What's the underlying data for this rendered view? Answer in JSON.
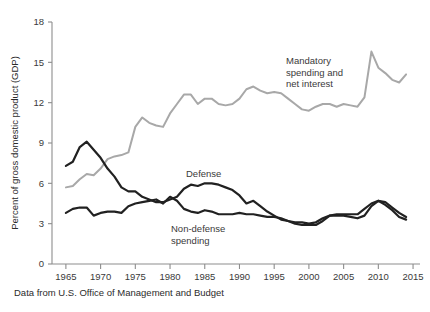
{
  "chart_data": {
    "type": "line",
    "title": "",
    "xlabel": "",
    "ylabel": "Percent of gross domestic product (GDP)",
    "caption": "Data from U.S. Office of Management and Budget",
    "xlim": [
      1963,
      2016
    ],
    "ylim": [
      0,
      18
    ],
    "x_ticks": [
      1965,
      1970,
      1975,
      1980,
      1985,
      1990,
      1995,
      2000,
      2005,
      2010,
      2015
    ],
    "y_ticks": [
      0,
      3,
      6,
      9,
      12,
      15,
      18
    ],
    "grid": false,
    "legend_position": "inline-annotations",
    "colors": {
      "mandatory": "#a8a8a8",
      "defense": "#212121",
      "nondefense": "#212121",
      "axis": "#8d8d8d",
      "text": "#2b2b2b",
      "background": "#ffffff"
    },
    "series": [
      {
        "name": "Mandatory spending and net interest",
        "color": "#a8a8a8",
        "label_lines": [
          "Mandatory",
          "spending and",
          "net interest"
        ],
        "x": [
          1965,
          1966,
          1967,
          1968,
          1969,
          1970,
          1971,
          1972,
          1973,
          1974,
          1975,
          1976,
          1977,
          1978,
          1979,
          1980,
          1981,
          1982,
          1983,
          1984,
          1985,
          1986,
          1987,
          1988,
          1989,
          1990,
          1991,
          1992,
          1993,
          1994,
          1995,
          1996,
          1997,
          1998,
          1999,
          2000,
          2001,
          2002,
          2003,
          2004,
          2005,
          2006,
          2007,
          2008,
          2009,
          2010,
          2011,
          2012,
          2013,
          2014
        ],
        "values": [
          5.7,
          5.8,
          6.3,
          6.7,
          6.6,
          7.1,
          7.8,
          8.0,
          8.1,
          8.3,
          10.2,
          10.9,
          10.5,
          10.3,
          10.2,
          11.2,
          11.9,
          12.6,
          12.6,
          11.9,
          12.3,
          12.3,
          11.9,
          11.8,
          11.9,
          12.3,
          13.0,
          13.2,
          12.9,
          12.7,
          12.8,
          12.7,
          12.3,
          11.9,
          11.5,
          11.4,
          11.7,
          11.9,
          11.9,
          11.7,
          11.9,
          11.8,
          11.7,
          12.4,
          15.8,
          14.6,
          14.2,
          13.7,
          13.5,
          14.1
        ]
      },
      {
        "name": "Defense",
        "color": "#212121",
        "label": "Defense",
        "x": [
          1965,
          1966,
          1967,
          1968,
          1969,
          1970,
          1971,
          1972,
          1973,
          1974,
          1975,
          1976,
          1977,
          1978,
          1979,
          1980,
          1981,
          1982,
          1983,
          1984,
          1985,
          1986,
          1987,
          1988,
          1989,
          1990,
          1991,
          1992,
          1993,
          1994,
          1995,
          1996,
          1997,
          1998,
          1999,
          2000,
          2001,
          2002,
          2003,
          2004,
          2005,
          2006,
          2007,
          2008,
          2009,
          2010,
          2011,
          2012,
          2013,
          2014
        ],
        "values": [
          7.3,
          7.6,
          8.7,
          9.1,
          8.5,
          7.9,
          7.1,
          6.5,
          5.7,
          5.4,
          5.4,
          5.0,
          4.8,
          4.6,
          4.6,
          4.8,
          5.0,
          5.6,
          5.9,
          5.8,
          6.0,
          6.0,
          5.9,
          5.7,
          5.5,
          5.1,
          4.5,
          4.7,
          4.3,
          3.9,
          3.6,
          3.3,
          3.2,
          3.0,
          2.9,
          2.9,
          2.9,
          3.2,
          3.6,
          3.7,
          3.7,
          3.7,
          3.7,
          4.1,
          4.5,
          4.7,
          4.6,
          4.2,
          3.8,
          3.5
        ]
      },
      {
        "name": "Non-defense spending",
        "color": "#212121",
        "label_lines": [
          "Non-defense",
          "spending"
        ],
        "x": [
          1965,
          1966,
          1967,
          1968,
          1969,
          1970,
          1971,
          1972,
          1973,
          1974,
          1975,
          1976,
          1977,
          1978,
          1979,
          1980,
          1981,
          1982,
          1983,
          1984,
          1985,
          1986,
          1987,
          1988,
          1989,
          1990,
          1991,
          1992,
          1993,
          1994,
          1995,
          1996,
          1997,
          1998,
          1999,
          2000,
          2001,
          2002,
          2003,
          2004,
          2005,
          2006,
          2007,
          2008,
          2009,
          2010,
          2011,
          2012,
          2013,
          2014
        ],
        "values": [
          3.8,
          4.1,
          4.2,
          4.2,
          3.6,
          3.8,
          3.9,
          3.9,
          3.8,
          4.3,
          4.5,
          4.6,
          4.7,
          4.8,
          4.5,
          5.0,
          4.7,
          4.1,
          3.9,
          3.8,
          4.0,
          3.9,
          3.7,
          3.7,
          3.7,
          3.8,
          3.7,
          3.7,
          3.6,
          3.5,
          3.5,
          3.4,
          3.2,
          3.1,
          3.1,
          3.0,
          3.1,
          3.4,
          3.6,
          3.6,
          3.6,
          3.5,
          3.4,
          3.6,
          4.3,
          4.7,
          4.4,
          4.0,
          3.5,
          3.3
        ]
      }
    ]
  }
}
